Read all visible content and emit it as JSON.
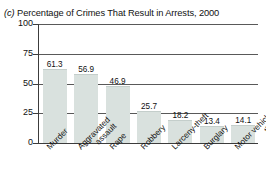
{
  "figure": {
    "panel_letter": "(c)",
    "title": " Percentage of Crimes That Result in Arrests, 2000"
  },
  "axis": {
    "y_ticks": [
      "100",
      "75",
      "50",
      "25",
      "0"
    ]
  },
  "chart_data": {
    "type": "bar",
    "title": "(c) Percentage of Crimes That Result in Arrests, 2000",
    "xlabel": "",
    "ylabel": "",
    "ylim": [
      0,
      100
    ],
    "yticks": [
      0,
      25,
      50,
      75,
      100
    ],
    "grid": true,
    "legend": "none",
    "categories": [
      "Murder",
      "Aggravated assault",
      "Rape",
      "Robbery",
      "Larceny-theft",
      "Burglary",
      "Motor vehicle theft"
    ],
    "category_lines": [
      [
        "Murder"
      ],
      [
        "Aggravated",
        "assault"
      ],
      [
        "Rape"
      ],
      [
        "Robbery"
      ],
      [
        "Larceny-theft"
      ],
      [
        "Burglary"
      ],
      [
        "Motor vehicle",
        "theft"
      ]
    ],
    "values": [
      61.3,
      56.9,
      46.9,
      25.7,
      18.2,
      13.4,
      14.1
    ],
    "value_labels": [
      "61.3",
      "56.9",
      "46.9",
      "25.7",
      "18.2",
      "13.4",
      "14.1"
    ],
    "bar_color": "#d9e1de",
    "axis_color": "#3c3c3c"
  }
}
